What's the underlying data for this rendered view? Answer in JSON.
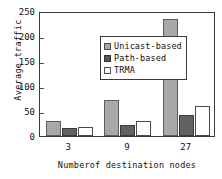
{
  "chart_data": {
    "type": "bar",
    "title": "",
    "xlabel": "Numberof destination nodes",
    "ylabel": "Average traffic",
    "categories": [
      "3",
      "9",
      "27"
    ],
    "series": [
      {
        "name": "Unicast-based",
        "values": [
          30,
          73,
          234
        ],
        "color": "#a8a8a8"
      },
      {
        "name": "Path-based",
        "values": [
          16,
          22,
          43
        ],
        "color": "#616161"
      },
      {
        "name": "TRMA",
        "values": [
          18,
          30,
          61
        ],
        "color": "#ffffff"
      }
    ],
    "ylim": [
      0,
      250
    ],
    "yticks": [
      0,
      50,
      100,
      150,
      200,
      250
    ],
    "ytick_labels": [
      "0",
      "50",
      "100",
      "150",
      "200",
      "250"
    ],
    "grid": false,
    "legend_position": "upper-left-inside"
  }
}
